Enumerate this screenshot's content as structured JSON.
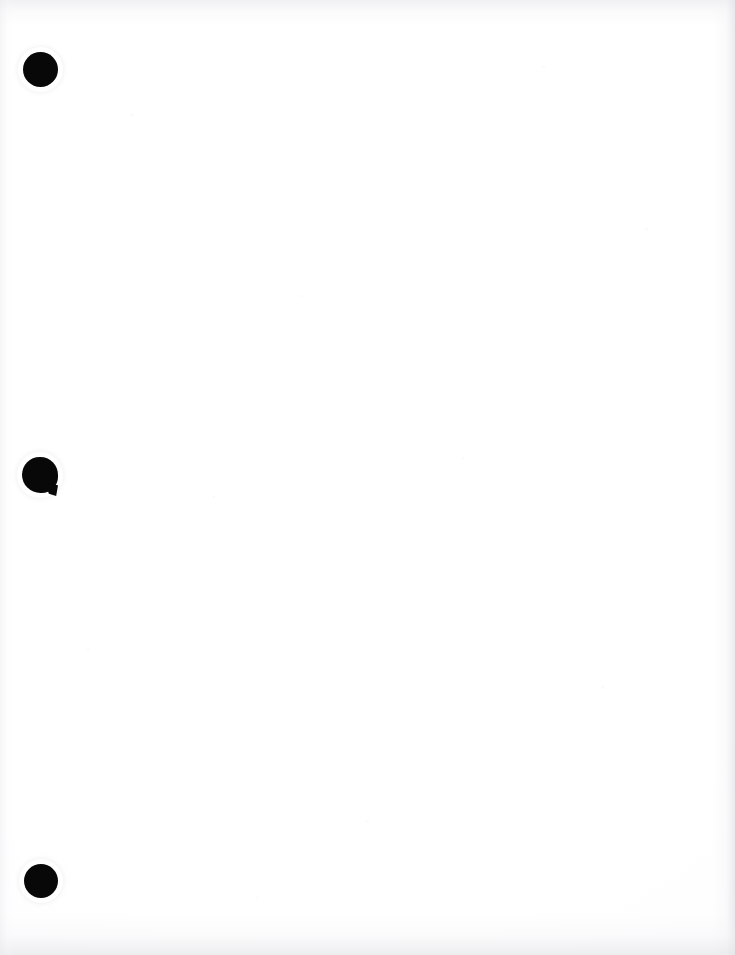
{
  "document": {
    "kind": "scanned-page",
    "page_state": "blank",
    "body_text": "",
    "visible_text": "",
    "page_width": 735,
    "page_height": 955,
    "background_color": "#ffffff",
    "ink_color": "#080808"
  },
  "binder_holes": {
    "count": 3,
    "margin_side": "left",
    "items": [
      {
        "id": "hole-1",
        "position_label": "top",
        "shape": "circle",
        "x": 23,
        "y": 52,
        "width": 35,
        "height": 35,
        "color": "#080808",
        "damaged": false
      },
      {
        "id": "hole-2",
        "position_label": "middle",
        "shape": "circle-with-tear",
        "x": 22,
        "y": 457,
        "width": 36,
        "height": 36,
        "color": "#080808",
        "damaged": true,
        "tear_note": "small torn tab at lower-right edge"
      },
      {
        "id": "hole-3",
        "position_label": "bottom",
        "shape": "circle",
        "x": 24,
        "y": 864,
        "width": 34,
        "height": 34,
        "color": "#080808",
        "damaged": false
      }
    ]
  },
  "scan_artifacts": {
    "edge_shading_color": "#e2e3e6",
    "speckle_color": "#e6e7ea",
    "edges": [
      "top",
      "right",
      "bottom",
      "left"
    ]
  }
}
